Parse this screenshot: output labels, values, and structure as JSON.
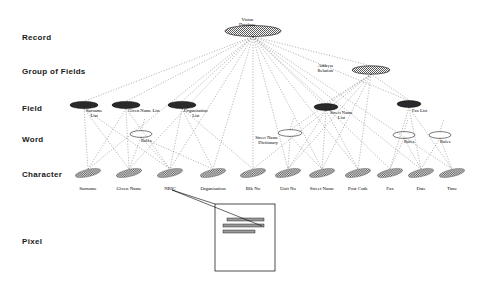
{
  "diagram": {
    "title_node": {
      "label": "Vision\nDatabase",
      "x": 253,
      "y": 31,
      "rx": 28,
      "ry": 5.5,
      "fill": "hatch"
    },
    "tiers": [
      {
        "name": "record",
        "label": "Record",
        "x": 22,
        "y": 33
      },
      {
        "name": "group-of-fields",
        "label": "Group of Fields",
        "x": 22,
        "y": 67
      },
      {
        "name": "field",
        "label": "Field",
        "x": 22,
        "y": 104
      },
      {
        "name": "word",
        "label": "Word",
        "x": 22,
        "y": 135
      },
      {
        "name": "character",
        "label": "Character",
        "x": 22,
        "y": 170
      },
      {
        "name": "pixel",
        "label": "Pixel",
        "x": 22,
        "y": 237
      }
    ],
    "group_nodes": [
      {
        "name": "address-relation",
        "label": "Address\nRelation",
        "x": 371,
        "y": 70,
        "rx": 19,
        "ry": 4.2,
        "fill": "hatch",
        "label_side": "left",
        "lx": 333,
        "ly": 63
      }
    ],
    "field_nodes": [
      {
        "name": "surname-list",
        "label": "Surname\nList",
        "x": 84,
        "y": 105,
        "rx": 14,
        "ry": 3.6,
        "lx": 86,
        "ly": 108
      },
      {
        "name": "given-name-list",
        "label": "Given Name List",
        "x": 126,
        "y": 105,
        "rx": 14,
        "ry": 3.6,
        "lx": 128,
        "ly": 108
      },
      {
        "name": "organisation-list",
        "label": "Organisation\nList",
        "x": 182,
        "y": 105,
        "rx": 14,
        "ry": 3.6,
        "lx": 184,
        "ly": 108
      },
      {
        "name": "street-name-list",
        "label": "Street Name\nList",
        "x": 326,
        "y": 107,
        "rx": 12,
        "ry": 3.4,
        "lx": 330,
        "ly": 110
      },
      {
        "name": "fax-list",
        "label": "Fax List",
        "x": 409,
        "y": 104,
        "rx": 12,
        "ry": 3.4,
        "lx": 412,
        "ly": 108
      }
    ],
    "word_nodes": [
      {
        "name": "rules-nric",
        "label": "Rules",
        "x": 141,
        "y": 134,
        "rx": 11,
        "ry": 3.4,
        "lx": 141,
        "ly": 138
      },
      {
        "name": "street-name-dict",
        "label": "Street Name\nDictionary",
        "x": 290,
        "y": 133,
        "rx": 12,
        "ry": 3.4,
        "lx": 278,
        "ly": 135,
        "label_side": "left"
      },
      {
        "name": "rules-fax",
        "label": "Rules",
        "x": 404,
        "y": 135,
        "rx": 11,
        "ry": 3.4,
        "lx": 404,
        "ly": 139
      },
      {
        "name": "rules-date",
        "label": "Rules",
        "x": 440,
        "y": 135,
        "rx": 11,
        "ry": 3.4,
        "lx": 440,
        "ly": 139
      }
    ],
    "character_nodes": [
      {
        "name": "char-surname",
        "x": 88,
        "y": 173
      },
      {
        "name": "char-given-name",
        "x": 129,
        "y": 173
      },
      {
        "name": "char-nric",
        "x": 170,
        "y": 173
      },
      {
        "name": "char-organisation",
        "x": 213,
        "y": 173
      },
      {
        "name": "char-blk-no",
        "x": 253,
        "y": 173
      },
      {
        "name": "char-unit-no",
        "x": 288,
        "y": 173
      },
      {
        "name": "char-street-name",
        "x": 322,
        "y": 173
      },
      {
        "name": "char-post-code",
        "x": 358,
        "y": 173
      },
      {
        "name": "char-fax",
        "x": 390,
        "y": 173
      },
      {
        "name": "char-date",
        "x": 421,
        "y": 173
      },
      {
        "name": "char-time",
        "x": 452,
        "y": 173
      }
    ],
    "bottom_labels": [
      {
        "name": "label-surname",
        "label": "Surname",
        "x": 88,
        "y": 186
      },
      {
        "name": "label-given-name",
        "label": "Given Name",
        "x": 129,
        "y": 186
      },
      {
        "name": "label-nric",
        "label": "NRIC",
        "x": 170,
        "y": 186
      },
      {
        "name": "label-organisation",
        "label": "Organisation",
        "x": 213,
        "y": 186
      },
      {
        "name": "label-blk-no",
        "label": "Blk No",
        "x": 253,
        "y": 186
      },
      {
        "name": "label-unit-no",
        "label": "Unit No",
        "x": 288,
        "y": 186
      },
      {
        "name": "label-street-name",
        "label": "Street Name",
        "x": 322,
        "y": 186
      },
      {
        "name": "label-post-code",
        "label": "Post Code",
        "x": 358,
        "y": 186
      },
      {
        "name": "label-fax",
        "label": "Fax",
        "x": 390,
        "y": 186
      },
      {
        "name": "label-date",
        "label": "Date",
        "x": 421,
        "y": 186
      },
      {
        "name": "label-time",
        "label": "Time",
        "x": 452,
        "y": 186
      }
    ],
    "pixel_box": {
      "name": "pixel-detail-box",
      "x": 215,
      "y": 204,
      "w": 60,
      "h": 67
    },
    "pixel_bars": [
      {
        "x": 227,
        "y": 218,
        "w": 37,
        "h": 3
      },
      {
        "x": 223,
        "y": 224,
        "w": 41,
        "h": 3
      },
      {
        "x": 223,
        "y": 230,
        "w": 32,
        "h": 3
      }
    ],
    "colors": {
      "ink": "#000000",
      "tier_text": "#1a1a1a",
      "node_fill": "#2a2a2a",
      "background": "#ffffff"
    }
  }
}
